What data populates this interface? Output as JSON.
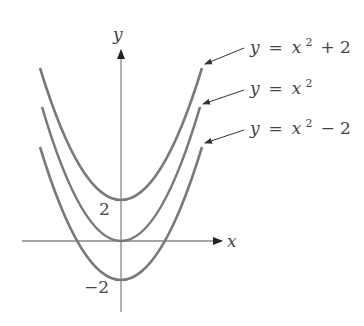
{
  "axes": {
    "x_label": "x",
    "y_label": "y",
    "tick_pos": "2",
    "tick_neg": "−2"
  },
  "curves": [
    {
      "name": "y = x^2 + 2",
      "lhs": "y",
      "eq": "=",
      "base": "x",
      "sup": "2",
      "tail": "+ 2",
      "shift": 2
    },
    {
      "name": "y = x^2",
      "lhs": "y",
      "eq": "=",
      "base": "x",
      "sup": "2",
      "tail": "",
      "shift": 0
    },
    {
      "name": "y = x^2 - 2",
      "lhs": "y",
      "eq": "=",
      "base": "x",
      "sup": "2",
      "tail": "− 2",
      "shift": -2
    }
  ],
  "colors": {
    "curve": "#777777",
    "axis": "#888888",
    "text": "#444444"
  }
}
